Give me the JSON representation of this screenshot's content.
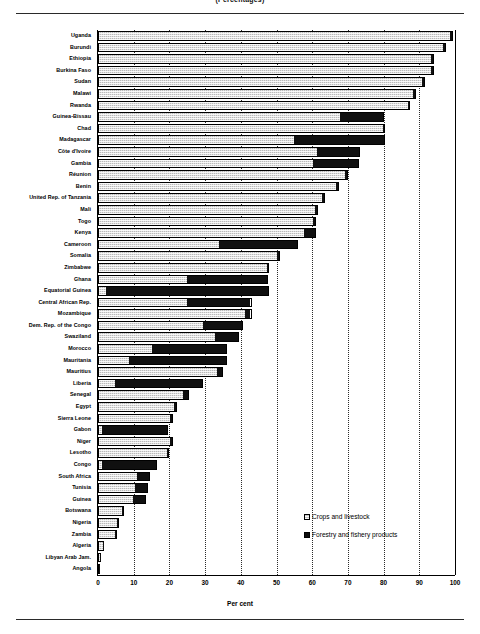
{
  "title": "(Percentages)",
  "axis": {
    "x_title": "Per cent",
    "ticks": [
      "0",
      "10",
      "20",
      "30",
      "40",
      "50",
      "60",
      "70",
      "80",
      "90",
      "100"
    ]
  },
  "legend": {
    "items": [
      {
        "label": "Crops and livestock",
        "color": "#b9b9b9",
        "key": "crops"
      },
      {
        "label": "Forestry and fishery products",
        "color": "#101010",
        "key": "forest"
      }
    ]
  },
  "chart_data": {
    "type": "bar",
    "orientation": "horizontal",
    "stacked": true,
    "title": "(Percentages)",
    "xlabel": "Per cent",
    "ylabel": "",
    "xlim": [
      0,
      100
    ],
    "grid": "vertical-dotted",
    "legend_position": "bottom-right",
    "categories": [
      "Uganda",
      "Burundi",
      "Ethiopia",
      "Burkina Faso",
      "Sudan",
      "Malawi",
      "Rwanda",
      "Guinea-Bissau",
      "Chad",
      "Madagascar",
      "Côte d'Ivoire",
      "Gambia",
      "Réunion",
      "Benin",
      "United Rep. of Tanzania",
      "Mali",
      "Togo",
      "Kenya",
      "Cameroon",
      "Somalia",
      "Zimbabwe",
      "Ghana",
      "Equatorial Guinea",
      "Central African Rep.",
      "Mozambique",
      "Dem. Rep. of the Congo",
      "Swaziland",
      "Morocco",
      "Mauritania",
      "Mauritius",
      "Liberia",
      "Senegal",
      "Egypt",
      "Sierra Leone",
      "Gabon",
      "Niger",
      "Lesotho",
      "Congo",
      "South Africa",
      "Tunisia",
      "Guinea",
      "Botswana",
      "Nigeria",
      "Zambia",
      "Algeria",
      "Libyan Arab Jam.",
      "Angola"
    ],
    "series": [
      {
        "name": "Crops and livestock",
        "values": [
          99.0,
          97.0,
          93.5,
          93.5,
          91.0,
          88.5,
          87.0,
          68.0,
          80.0,
          55.0,
          61.5,
          60.5,
          69.5,
          67.0,
          63.0,
          61.0,
          60.5,
          58.0,
          34.0,
          50.5,
          47.5,
          25.0,
          2.0,
          25.0,
          41.5,
          29.5,
          33.0,
          15.0,
          8.5,
          33.5,
          4.5,
          24.0,
          21.5,
          20.5,
          1.0,
          20.5,
          19.5,
          1.0,
          11.0,
          10.5,
          10.0,
          7.0,
          5.5,
          5.0,
          1.5,
          0.5,
          0.4
        ]
      },
      {
        "name": "Forestry and fishery products",
        "values": [
          0.5,
          0.5,
          0.5,
          0.5,
          0.5,
          0.5,
          0.5,
          12.0,
          0.5,
          25.5,
          12.0,
          12.5,
          0.5,
          0.5,
          0.5,
          0.5,
          0.5,
          3.0,
          22.0,
          0.5,
          0.5,
          22.5,
          46.0,
          18.0,
          1.5,
          11.0,
          6.5,
          21.0,
          27.5,
          1.5,
          25.0,
          1.5,
          0.5,
          0.5,
          18.5,
          0.5,
          0.5,
          15.5,
          3.5,
          3.5,
          3.5,
          0.3,
          0.3,
          0.3,
          0.3,
          0.3,
          0.3
        ]
      }
    ],
    "totals": [
      99.5,
      97.5,
      94.0,
      94.0,
      91.5,
      89.0,
      87.5,
      80.0,
      80.5,
      80.5,
      73.5,
      73.0,
      70.0,
      67.5,
      63.5,
      61.5,
      61.0,
      61.0,
      56.0,
      51.0,
      48.0,
      47.5,
      48.0,
      43.0,
      43.0,
      40.5,
      39.5,
      36.0,
      36.0,
      35.0,
      29.5,
      25.5,
      22.0,
      21.0,
      19.5,
      21.0,
      20.0,
      16.5,
      14.5,
      14.0,
      13.5,
      7.3,
      5.8,
      5.3,
      1.8,
      0.8,
      0.7
    ]
  }
}
